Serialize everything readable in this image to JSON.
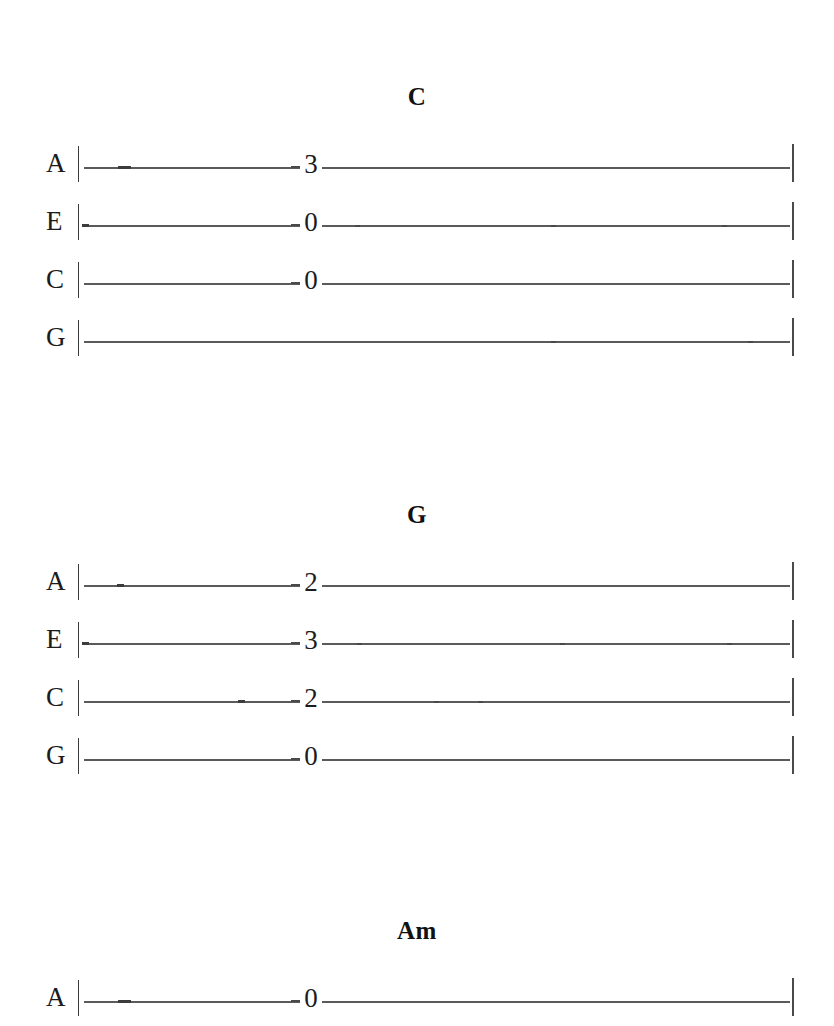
{
  "document": {
    "kind": "ukulele-tablature",
    "background_color": "#ffffff",
    "ink_color": "#1c1c1c",
    "line_color": "#5a5a5a"
  },
  "sections": [
    {
      "id": "section-c",
      "title": "C",
      "top": 84,
      "rows": [
        {
          "string": "A",
          "fret": "3",
          "fret_x": 300,
          "has_fret": true,
          "ticks": [
            118,
            124
          ],
          "mid_ticks": []
        },
        {
          "string": "E",
          "fret": "0",
          "fret_x": 300,
          "has_fret": true,
          "ticks": [
            82
          ],
          "mid_ticks": [
            355,
            551,
            722
          ]
        },
        {
          "string": "C",
          "fret": "0",
          "fret_x": 300,
          "has_fret": true,
          "ticks": [],
          "mid_ticks": []
        },
        {
          "string": "G",
          "fret": "",
          "fret_x": 300,
          "has_fret": false,
          "ticks": [],
          "mid_ticks": [
            551,
            748
          ]
        }
      ]
    },
    {
      "id": "section-g",
      "title": "G",
      "top": 502,
      "rows": [
        {
          "string": "A",
          "fret": "2",
          "fret_x": 300,
          "has_fret": true,
          "ticks": [
            117
          ],
          "mid_ticks": []
        },
        {
          "string": "E",
          "fret": "3",
          "fret_x": 300,
          "has_fret": true,
          "ticks": [
            82
          ],
          "mid_ticks": [
            357,
            560,
            727
          ]
        },
        {
          "string": "C",
          "fret": "2",
          "fret_x": 300,
          "has_fret": true,
          "ticks": [
            238
          ],
          "mid_ticks": [
            434,
            478
          ]
        },
        {
          "string": "G",
          "fret": "0",
          "fret_x": 300,
          "has_fret": true,
          "ticks": [],
          "mid_ticks": []
        }
      ]
    },
    {
      "id": "section-am",
      "title": "Am",
      "top": 918,
      "rows": [
        {
          "string": "A",
          "fret": "0",
          "fret_x": 300,
          "has_fret": true,
          "ticks": [
            118,
            124
          ],
          "mid_ticks": []
        }
      ]
    }
  ],
  "tab_geometry": {
    "left_bar_x": 78,
    "right_bar_x": 792,
    "line_start_x": 84,
    "line_end_x": 790,
    "row_height": 58
  }
}
